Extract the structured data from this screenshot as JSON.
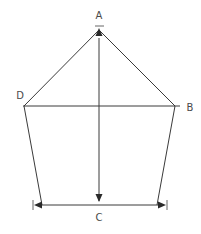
{
  "diagram": {
    "type": "geometric-figure",
    "labels": {
      "A": "A",
      "B": "B",
      "C": "C",
      "D": "D"
    },
    "points": {
      "A": [
        99,
        30
      ],
      "D": [
        24,
        106
      ],
      "B": [
        175,
        106
      ],
      "bottom_left": [
        42,
        205
      ],
      "bottom_right": [
        157,
        205
      ]
    },
    "colors": {
      "line": "#3a3a3a",
      "text": "#4a4a4a",
      "background": "#ffffff"
    }
  }
}
